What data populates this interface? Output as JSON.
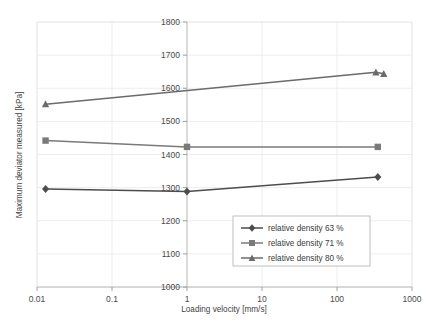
{
  "chart_data": {
    "type": "line",
    "title": "",
    "xlabel": "Loading velocity [mm/s]",
    "ylabel": "Maximum deviator measured [kPa]",
    "x_scale": "log",
    "xlim": [
      0.01,
      1000
    ],
    "ylim": [
      1000,
      1800
    ],
    "x_ticks": [
      "0.01",
      "0.1",
      "1",
      "10",
      "100",
      "1000"
    ],
    "x_tick_values": [
      0.01,
      0.1,
      1,
      10,
      100,
      1000
    ],
    "y_ticks": [
      "1000",
      "1100",
      "1200",
      "1300",
      "1400",
      "1500",
      "1600",
      "1700",
      "1800"
    ],
    "y_tick_values": [
      1000,
      1100,
      1200,
      1300,
      1400,
      1500,
      1600,
      1700,
      1800
    ],
    "grid": true,
    "legend_position": "inside-lower-right",
    "series": [
      {
        "name": "relative density 63 %",
        "marker": "diamond",
        "color": "#4d4d4d",
        "points": [
          {
            "x": 0.013,
            "y": 1296
          },
          {
            "x": 1.0,
            "y": 1288
          },
          {
            "x": 350,
            "y": 1332
          }
        ]
      },
      {
        "name": "relative density 71 %",
        "marker": "square",
        "color": "#7a7a7a",
        "points": [
          {
            "x": 0.013,
            "y": 1442
          },
          {
            "x": 1.0,
            "y": 1423
          },
          {
            "x": 350,
            "y": 1423
          }
        ]
      },
      {
        "name": "relative density 80 %",
        "marker": "triangle",
        "color": "#6b6b6b",
        "points": [
          {
            "x": 0.013,
            "y": 1552
          },
          {
            "x": 330,
            "y": 1648
          },
          {
            "x": 420,
            "y": 1644
          }
        ]
      }
    ]
  },
  "legend": {
    "entries": [
      {
        "label": "relative density 63 %",
        "marker": "diamond",
        "color": "#4d4d4d"
      },
      {
        "label": "relative density 71 %",
        "marker": "square",
        "color": "#7a7a7a"
      },
      {
        "label": "relative density 80 %",
        "marker": "triangle",
        "color": "#6b6b6b"
      }
    ]
  }
}
